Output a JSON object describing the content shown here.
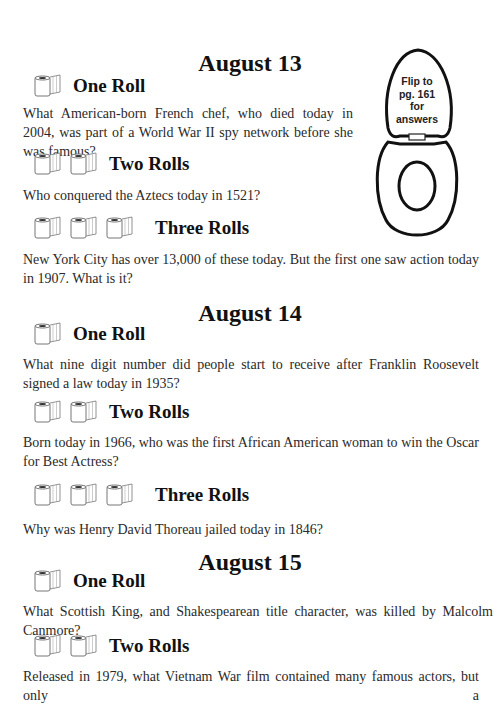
{
  "sections": [
    {
      "date": "August 13",
      "questions": [
        {
          "level": "One Roll",
          "rolls": 1,
          "text": "What American-born French chef, who died today in 2004, was part of a World War II spy network before she was famous?"
        },
        {
          "level": "Two Rolls",
          "rolls": 2,
          "text": "Who conquered the Aztecs today in 1521?"
        },
        {
          "level": "Three Rolls",
          "rolls": 3,
          "text": "New York City has over 13,000 of these today. But the first one saw action today in 1907. What is it?"
        }
      ]
    },
    {
      "date": "August 14",
      "questions": [
        {
          "level": "One Roll",
          "rolls": 1,
          "text": "What nine digit number did people start to receive after Franklin Roosevelt signed a law today in 1935?"
        },
        {
          "level": "Two Rolls",
          "rolls": 2,
          "text": "Born today in 1966, who was the first African American woman to win the Oscar for Best Actress?"
        },
        {
          "level": "Three Rolls",
          "rolls": 3,
          "text": "Why was Henry David Thoreau jailed today in 1846?"
        }
      ]
    },
    {
      "date": "August 15",
      "questions": [
        {
          "level": "One Roll",
          "rolls": 1,
          "text": "What Scottish King, and Shakespearean title character, was killed by Malcolm Canmore?"
        },
        {
          "level": "Two Rolls",
          "rolls": 2,
          "text": "Released in 1979, what Vietnam War film contained many famous actors, but only a"
        }
      ]
    }
  ],
  "answer_note": {
    "lines": [
      "Flip to",
      "pg. 161",
      "for",
      "answers"
    ],
    "icon": "toilet-seat-icon"
  },
  "icons": {
    "roll": "toilet-paper-roll-icon"
  }
}
